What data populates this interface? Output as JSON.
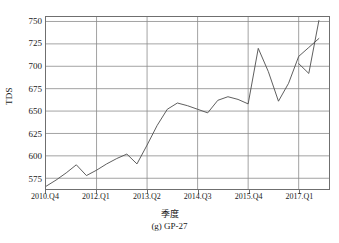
{
  "chart_data": {
    "type": "line",
    "title": "",
    "caption": "(g) GP-27",
    "xlabel": "季度",
    "ylabel": "TDS",
    "grid": true,
    "legend": "none",
    "ylim": [
      563,
      755
    ],
    "yticks": [
      575,
      600,
      625,
      650,
      675,
      700,
      725,
      750
    ],
    "xlim": [
      0,
      28
    ],
    "xtick_positions": [
      0,
      5,
      10,
      15,
      20,
      25
    ],
    "xtick_labels": [
      "2010.Q4",
      "2012.Q1",
      "2013.Q2",
      "2014.Q3",
      "2015.Q4",
      "2017.Q1"
    ],
    "x": [
      0,
      1,
      2,
      3,
      4,
      5,
      6,
      7,
      8,
      9,
      10,
      11,
      12,
      13,
      14,
      15,
      16,
      17,
      18,
      19,
      20,
      21,
      22,
      23,
      24,
      25,
      26,
      27
    ],
    "series": [
      {
        "name": "TDS",
        "values": [
          566,
          573,
          581,
          590,
          578,
          584,
          591,
          597,
          602,
          591,
          612,
          634,
          652,
          659,
          656,
          652,
          648,
          662,
          666,
          663,
          658,
          720,
          694,
          661,
          681,
          711,
          721,
          731
        ]
      },
      {
        "name": "TDS-alt",
        "x": [
          25,
          26,
          27
        ],
        "values": [
          703,
          692,
          751
        ]
      }
    ],
    "line_color": "#4d4d4d",
    "grid_color": "#8c8c8c",
    "axis_color": "#6f6f6f"
  }
}
